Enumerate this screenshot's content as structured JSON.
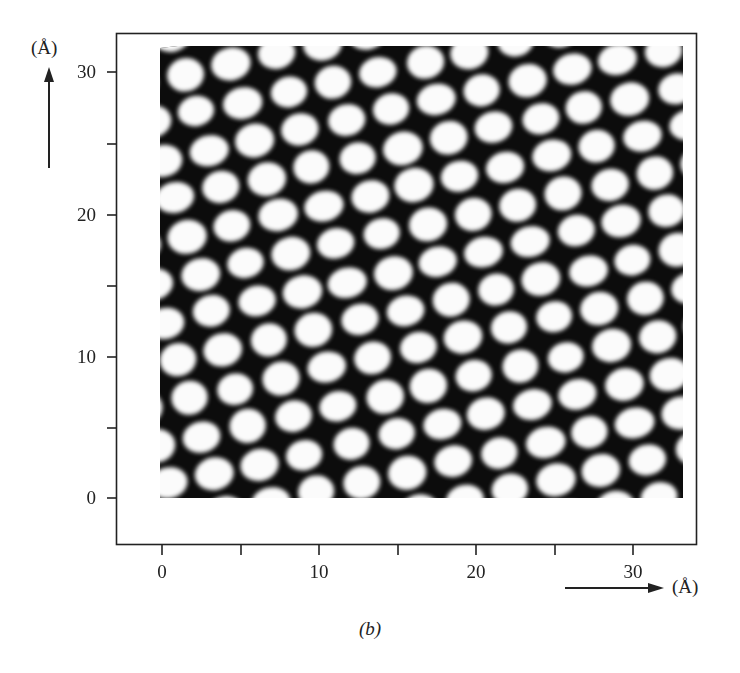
{
  "figure": {
    "caption": "(b)",
    "y_unit_label": "(Å)",
    "x_unit_label": "(Å)",
    "image_description": "STM-like image: hexagonal lattice of bright atomic spots on dark background"
  },
  "chart_data": {
    "type": "heatmap",
    "title": "",
    "panel_label": "(b)",
    "xlabel": "(Å)",
    "ylabel": "(Å)",
    "xlim": [
      0,
      33
    ],
    "ylim": [
      0,
      32
    ],
    "x_ticks_major": [
      0,
      10,
      20,
      30
    ],
    "x_ticks_minor": [
      5,
      15,
      25
    ],
    "y_ticks_major": [
      0,
      10,
      20,
      30
    ],
    "y_ticks_minor": [
      5,
      15,
      25
    ],
    "x_tick_labels": [
      "0",
      "10",
      "20",
      "30"
    ],
    "y_tick_labels": [
      "0",
      "10",
      "20",
      "30"
    ],
    "grid": false,
    "legend": null,
    "content": "hexagonal close-packed lattice of bright spots, spacing approx. 3 Å, rotated about 12°"
  },
  "axes": {
    "y_ticks": [
      {
        "label": "30",
        "px": 72
      },
      {
        "label": "20",
        "px": 215
      },
      {
        "label": "10",
        "px": 357
      },
      {
        "label": "0",
        "px": 498
      }
    ],
    "x_ticks": [
      {
        "label": "0",
        "px": 162
      },
      {
        "label": "10",
        "px": 319
      },
      {
        "label": "20",
        "px": 476
      },
      {
        "label": "30",
        "px": 633
      }
    ]
  },
  "lattice": {
    "origin": [
      190,
      398
    ],
    "a": [
      45.5,
      -10
    ],
    "b": [
      12,
      38
    ],
    "rx": 19,
    "ry": 16,
    "bg": "#0c0c0c",
    "spot": "#fbfbfb"
  }
}
